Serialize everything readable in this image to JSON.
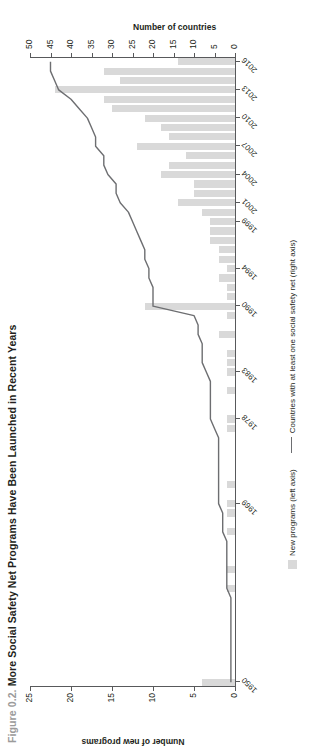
{
  "figure": {
    "number": "Figure 0.2.",
    "title": "More Social Safety Net Programs Have Been Launched in Recent Years"
  },
  "legend": {
    "bar_label": "New programs (left axis)",
    "line_label": "Countries with at least one social safety net (right axis)"
  },
  "chart_data": {
    "type": "bar",
    "title": "More Social Safety Net Programs Have Been Launched in Recent Years",
    "xlabel": "",
    "ylabel": "Number of new programs",
    "y2label": "Number of countries",
    "ylim": [
      0,
      25
    ],
    "y2lim": [
      0,
      50
    ],
    "yticks": [
      0,
      5,
      10,
      15,
      20,
      25
    ],
    "y2ticks": [
      0,
      5,
      10,
      15,
      20,
      25,
      30,
      35,
      40,
      45,
      50
    ],
    "grid": false,
    "legend_position": "bottom",
    "categories": [
      "1950",
      "1951",
      "1952",
      "1953",
      "1954",
      "1955",
      "1956",
      "1957",
      "1958",
      "1959",
      "1960",
      "1961",
      "1962",
      "1963",
      "1964",
      "1965",
      "1966",
      "1967",
      "1968",
      "1969",
      "1970",
      "1971",
      "1972",
      "1973",
      "1974",
      "1975",
      "1976",
      "1977",
      "1978",
      "1979",
      "1980",
      "1981",
      "1982",
      "1983",
      "1984",
      "1985",
      "1986",
      "1987",
      "1988",
      "1989",
      "1990",
      "1991",
      "1992",
      "1993",
      "1994",
      "1995",
      "1996",
      "1997",
      "1998",
      "1999",
      "2000",
      "2001",
      "2002",
      "2003",
      "2004",
      "2005",
      "2006",
      "2007",
      "2008",
      "2009",
      "2010",
      "2011",
      "2012",
      "2013",
      "2014",
      "2015",
      "2016"
    ],
    "tick_labels": [
      "1950",
      "1969",
      "1978",
      "1983",
      "1990",
      "1994",
      "1999",
      "2001",
      "2004",
      "2007",
      "2010",
      "2013",
      "2016"
    ],
    "tick_label_indices": [
      0,
      19,
      28,
      33,
      40,
      44,
      49,
      51,
      54,
      57,
      60,
      63,
      66
    ],
    "series": [
      {
        "name": "New programs (left axis)",
        "axis": "left",
        "type": "bar",
        "color": "#d9d9d9",
        "values": [
          4,
          0,
          0,
          0,
          0,
          0,
          0,
          0,
          0,
          0,
          1,
          0,
          1,
          0,
          0,
          0,
          1,
          0,
          1,
          1,
          0,
          1,
          0,
          0,
          0,
          0,
          0,
          1,
          1,
          0,
          0,
          1,
          0,
          1,
          1,
          1,
          0,
          2,
          0,
          1,
          11,
          1,
          1,
          2,
          1,
          2,
          2,
          3,
          3,
          3,
          4,
          7,
          5,
          5,
          9,
          8,
          6,
          12,
          8,
          9,
          11,
          15,
          16,
          22,
          14,
          16,
          7
        ]
      },
      {
        "name": "Countries with at least one social safety net (right axis)",
        "axis": "right",
        "type": "line",
        "color": "#6d6e71",
        "values": [
          1,
          1,
          1,
          1,
          1,
          1,
          1,
          1,
          1,
          1,
          2,
          2,
          2,
          2,
          2,
          2,
          3,
          3,
          3,
          4,
          4,
          4,
          4,
          4,
          4,
          4,
          4,
          5,
          6,
          6,
          6,
          6,
          6,
          7,
          8,
          8,
          8,
          9,
          9,
          10,
          20,
          20,
          20,
          21,
          21,
          22,
          22,
          23,
          24,
          25,
          26,
          28,
          29,
          29,
          31,
          32,
          32,
          34,
          34,
          35,
          36,
          38,
          40,
          43,
          44,
          45,
          45
        ]
      }
    ]
  }
}
